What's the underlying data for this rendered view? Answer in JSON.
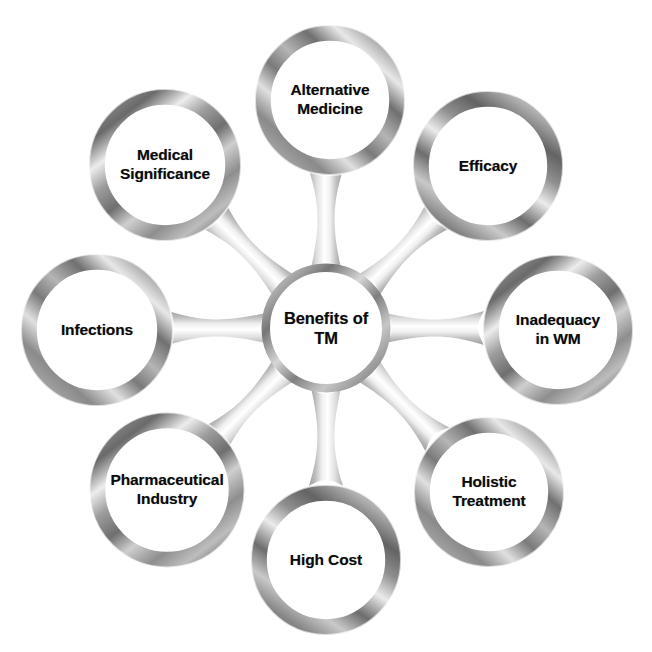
{
  "diagram": {
    "type": "hub-and-spoke-wheel",
    "background_color": "#ffffff",
    "text_color": "#0b0b0b",
    "ring_colors": {
      "dark_bevel": "#5e5e5e",
      "mid_bevel": "#9a9a9a",
      "light_bevel": "#d8d8d8",
      "highlight": "#f2f2f2",
      "connector": "#cfcfcf"
    },
    "hub": {
      "id": "hub",
      "label": "Benefits of\nTM",
      "cx": 326,
      "cy": 328,
      "outer_radius": 64,
      "inner_radius": 55
    },
    "nodes": [
      {
        "id": "alternative-medicine",
        "label": "Alternative\nMedicine",
        "angle_deg": -90,
        "cx": 330,
        "cy": 100,
        "outer_radius": 75,
        "inner_radius": 58
      },
      {
        "id": "efficacy",
        "label": "Efficacy",
        "angle_deg": -45,
        "cx": 488,
        "cy": 166,
        "outer_radius": 75,
        "inner_radius": 58
      },
      {
        "id": "inadequacy-in-wm",
        "label": "Inadequacy\nin WM",
        "angle_deg": 0,
        "cx": 558,
        "cy": 330,
        "outer_radius": 75,
        "inner_radius": 58
      },
      {
        "id": "holistic-treatment",
        "label": "Holistic\nTreatment",
        "angle_deg": 45,
        "cx": 489,
        "cy": 492,
        "outer_radius": 75,
        "inner_radius": 58
      },
      {
        "id": "high-cost",
        "label": "High Cost",
        "angle_deg": 90,
        "cx": 326,
        "cy": 560,
        "outer_radius": 75,
        "inner_radius": 58
      },
      {
        "id": "pharmaceutical-industry",
        "label": "Pharmaceutical\nIndustry",
        "angle_deg": 135,
        "cx": 167,
        "cy": 490,
        "outer_radius": 78,
        "inner_radius": 60
      },
      {
        "id": "infections",
        "label": "Infections",
        "angle_deg": 180,
        "cx": 97,
        "cy": 330,
        "outer_radius": 76,
        "inner_radius": 59
      },
      {
        "id": "medical-significance",
        "label": "Medical\nSignificance",
        "angle_deg": -135,
        "cx": 165,
        "cy": 165,
        "outer_radius": 76,
        "inner_radius": 59
      }
    ]
  }
}
